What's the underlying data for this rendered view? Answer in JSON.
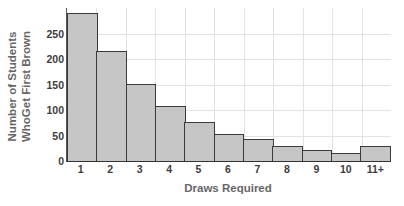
{
  "chart_data": {
    "type": "bar",
    "title": "",
    "subtitle": "",
    "xlabel": "Draws Required",
    "ylabel_lines": [
      "Number of Students",
      "WhoGet First Brown"
    ],
    "ylabel": "Number of Students WhoGet First Brown",
    "categories": [
      "1",
      "2",
      "3",
      "4",
      "5",
      "6",
      "7",
      "8",
      "9",
      "10",
      "11+"
    ],
    "values": [
      290,
      215,
      151,
      107,
      77,
      52,
      43,
      29,
      21,
      16,
      29
    ],
    "series": [
      {
        "name": "Number of Students Who Get First Brown",
        "values": [
          290,
          215,
          151,
          107,
          77,
          52,
          43,
          29,
          21,
          16,
          29
        ]
      }
    ],
    "ylim": [
      0,
      300
    ],
    "xlim_categories": 11,
    "ytick_values": [
      0,
      50,
      100,
      150,
      200,
      250
    ],
    "ytick_labels": [
      "0",
      "50",
      "100",
      "150",
      "200",
      "250"
    ],
    "grid": true,
    "grid_axes": "both",
    "legend": false,
    "legend_position": "none",
    "bar_gap": 0,
    "annotations": []
  },
  "style": {
    "bar_fill": "#c6c6c6",
    "bar_border": "#3a3a3a",
    "grid_color": "#e2e2e2",
    "axis_color": "#444444",
    "tick_text_color": "#3d3d3d",
    "axis_title_color": "#666666",
    "background": "#ffffff"
  }
}
